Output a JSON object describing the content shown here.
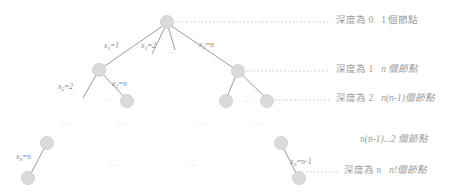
{
  "diagram": {
    "node_fill": "#d9d9d9",
    "node_stroke": "#c9c9c9",
    "edge_color": "#8f8f8f",
    "leader_color": "#bdbdbd",
    "text_color": "#9b9b9b",
    "background": "#ffffff"
  },
  "depth_labels": [
    {
      "id": "depth-0",
      "depth_text": "深度為 0",
      "count_text": "1 個節點"
    },
    {
      "id": "depth-1",
      "depth_text": "深度為 1",
      "count_text": "n 個節點"
    },
    {
      "id": "depth-2",
      "depth_text": "深度為 2",
      "count_text": "n(n-1)個節點"
    },
    {
      "id": "depth-n",
      "depth_text": "深度為 n",
      "count_text": "n!個節點"
    }
  ],
  "standalone_counts": [
    {
      "id": "count-second-last",
      "text": "n(n-1)...2 個節點"
    }
  ],
  "edge_labels": [
    {
      "id": "edge-x1-eq-1",
      "var": "x",
      "sub": "1",
      "value": "1"
    },
    {
      "id": "edge-x1-eq-2",
      "var": "x",
      "sub": "1",
      "value": "2"
    },
    {
      "id": "edge-x1-eq-n",
      "var": "x",
      "sub": "1",
      "value": "n"
    },
    {
      "id": "edge-x2-eq-2",
      "var": "x",
      "sub": "2",
      "value": "2"
    },
    {
      "id": "edge-x2-eq-n",
      "var": "x",
      "sub": "1",
      "value": "n"
    },
    {
      "id": "edge-xn-eq-n",
      "var": "x",
      "sub": "n",
      "value": "n"
    },
    {
      "id": "edge-xn-eq-n-1",
      "var": "x",
      "sub": "n",
      "value": "n-1"
    }
  ],
  "ellipses": [
    {
      "id": "ellipsis-level1-middle",
      "text": "..."
    },
    {
      "id": "ellipsis-level2-left",
      "text": "..."
    },
    {
      "id": "ellipsis-level2-right",
      "text": "..."
    },
    {
      "id": "ellipsis-row-a",
      "text": "..."
    },
    {
      "id": "ellipsis-row-b",
      "text": "..."
    },
    {
      "id": "ellipsis-row-c",
      "text": "..."
    },
    {
      "id": "ellipsis-row-d",
      "text": "..."
    },
    {
      "id": "ellipsis-bottom-left",
      "text": "..."
    },
    {
      "id": "ellipsis-bottom-right",
      "text": "..."
    }
  ]
}
